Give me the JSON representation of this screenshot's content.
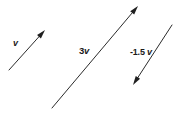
{
  "figure": {
    "background_color": "#ffffff",
    "stroke_color": "#2b2b2b",
    "text_color": "#1a1a1a",
    "width": 182,
    "height": 115
  },
  "vectors": [
    {
      "name": "v",
      "label_scalar": "",
      "label_symbol": "v",
      "tail": {
        "x": 9,
        "y": 70
      },
      "tip": {
        "x": 45,
        "y": 30
      },
      "direction": "up-right",
      "scale_factor": 1
    },
    {
      "name": "3v",
      "label_scalar": "3",
      "label_symbol": "v",
      "tail": {
        "x": 52,
        "y": 108
      },
      "tip": {
        "x": 138,
        "y": 6
      },
      "direction": "up-right",
      "scale_factor": 3
    },
    {
      "name": "-1.5v",
      "label_scalar": "-1.5 ",
      "label_symbol": "v",
      "tail": {
        "x": 172,
        "y": 25
      },
      "tip": {
        "x": 133,
        "y": 85
      },
      "direction": "down-left",
      "scale_factor": -1.5
    }
  ]
}
